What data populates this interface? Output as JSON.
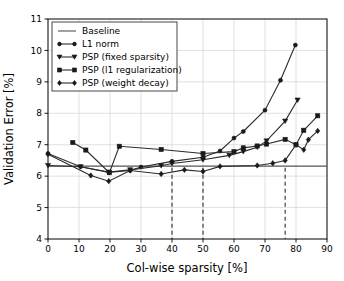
{
  "chart_data": {
    "type": "line",
    "title": "",
    "xlabel": "Col-wise sparsity [%]",
    "ylabel": "Validation Error [%]",
    "xlim": [
      0,
      90
    ],
    "ylim": [
      4,
      11
    ],
    "xticks": [
      "0",
      "10",
      "20",
      "30",
      "40",
      "50",
      "60",
      "70",
      "80",
      "90"
    ],
    "yticks": [
      "4",
      "5",
      "6",
      "7",
      "8",
      "9",
      "10",
      "11"
    ],
    "grid": true,
    "legend_position": "upper left",
    "annotations": {
      "vertical_dashed_lines": [
        40,
        50,
        76.5
      ]
    },
    "series": [
      {
        "name": "Baseline",
        "marker": "none",
        "points": [
          [
            0,
            6.32
          ],
          [
            90,
            6.32
          ]
        ]
      },
      {
        "name": "L1 norm",
        "marker": "circle",
        "points": [
          [
            0,
            6.72
          ],
          [
            10.5,
            6.3
          ],
          [
            19.6,
            6.12
          ],
          [
            26.5,
            6.18
          ],
          [
            30.0,
            6.29
          ],
          [
            40.0,
            6.47
          ],
          [
            50.0,
            6.6
          ],
          [
            55.5,
            6.8
          ],
          [
            60.0,
            7.21
          ],
          [
            63.0,
            7.42
          ],
          [
            70.0,
            8.1
          ],
          [
            75.0,
            9.05
          ],
          [
            79.8,
            10.17
          ]
        ]
      },
      {
        "name": "PSP (fixed sparsity)",
        "marker": "triangle-down",
        "points": [
          [
            0,
            6.34
          ],
          [
            10.5,
            6.3
          ],
          [
            19.6,
            6.13
          ],
          [
            26.5,
            6.2
          ],
          [
            36.5,
            6.33
          ],
          [
            40.0,
            6.4
          ],
          [
            50.0,
            6.52
          ],
          [
            58.5,
            6.66
          ],
          [
            63.0,
            6.78
          ],
          [
            67.5,
            6.92
          ],
          [
            70.5,
            7.12
          ],
          [
            76.5,
            7.75
          ],
          [
            80.5,
            8.42
          ]
        ]
      },
      {
        "name": "PSP (l1 regularization)",
        "marker": "square",
        "points": [
          [
            8.0,
            7.07
          ],
          [
            12.2,
            6.83
          ],
          [
            19.8,
            6.11
          ],
          [
            23.0,
            6.95
          ],
          [
            36.5,
            6.85
          ],
          [
            50.0,
            6.72
          ],
          [
            60.0,
            6.78
          ],
          [
            63.0,
            6.9
          ],
          [
            67.5,
            6.96
          ],
          [
            70.5,
            7.02
          ],
          [
            76.5,
            7.17
          ],
          [
            80.0,
            7.0
          ],
          [
            82.5,
            7.46
          ],
          [
            87.0,
            7.92
          ]
        ]
      },
      {
        "name": "PSP (weight decay)",
        "marker": "diamond",
        "points": [
          [
            0,
            6.7
          ],
          [
            13.8,
            6.02
          ],
          [
            19.6,
            5.84
          ],
          [
            26.5,
            6.18
          ],
          [
            36.5,
            6.07
          ],
          [
            44.0,
            6.2
          ],
          [
            50.0,
            6.15
          ],
          [
            55.5,
            6.31
          ],
          [
            67.5,
            6.34
          ],
          [
            72.5,
            6.41
          ],
          [
            76.5,
            6.5
          ],
          [
            80.0,
            7.0
          ],
          [
            82.5,
            6.84
          ],
          [
            84.0,
            7.16
          ],
          [
            87.0,
            7.44
          ]
        ]
      }
    ],
    "legend_entries": [
      {
        "label": "Baseline",
        "marker": "none"
      },
      {
        "label": "L1 norm",
        "marker": "circle"
      },
      {
        "label": "PSP (fixed sparsity)",
        "marker": "triangle-down"
      },
      {
        "label": "PSP (l1 regularization)",
        "marker": "square"
      },
      {
        "label": "PSP (weight decay)",
        "marker": "diamond"
      }
    ],
    "colors": {
      "line": "#2b2b2b",
      "baseline": "#555555",
      "grid": "#d8d8d8",
      "dashed_marker_line": "#303030",
      "background": "#ffffff"
    }
  }
}
